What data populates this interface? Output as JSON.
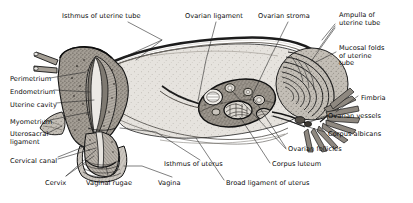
{
  "figure": {
    "type": "anatomical-illustration",
    "style": "grayscale line drawing with stippled shading",
    "background_color": "#ffffff",
    "line_color": "#111111",
    "palette": {
      "broad_ligament_fill": "#e0ddd8",
      "uterine_wall_fill": "#b8b3ac",
      "endometrium_fill": "#9b958d",
      "myometrium_fill": "#a8a29a",
      "ovary_fill": "#8f8981",
      "tube_fill": "#c9c4bd",
      "follicle_fill": "#f2f0ec",
      "corpus_luteum_fill": "#d8d4cd",
      "dark_outline": "#1a1a1a"
    }
  },
  "labels": [
    {
      "id": "isthmus-of-uterine-tube",
      "text": "Isthmus of uterine tube",
      "lines": [
        "Isthmus of uterine tube"
      ],
      "x": 62,
      "y": 13,
      "align": "left"
    },
    {
      "id": "ovarian-ligament",
      "text": "Ovarian ligament",
      "lines": [
        "Ovarian ligament"
      ],
      "x": 185,
      "y": 13,
      "align": "left"
    },
    {
      "id": "ovarian-stroma",
      "text": "Ovarian stroma",
      "lines": [
        "Ovarian stroma"
      ],
      "x": 258,
      "y": 13,
      "align": "left"
    },
    {
      "id": "ampulla-of-uterine-tube",
      "text": "Ampulla of uterine tube",
      "lines": [
        "Ampulla of",
        "uterine tube"
      ],
      "x": 339,
      "y": 12,
      "align": "left"
    },
    {
      "id": "mucosal-folds-of-uterine-tube",
      "text": "Mucosal folds of uterine tube",
      "lines": [
        "Mucosal folds",
        "of uterine",
        "tube"
      ],
      "x": 339,
      "y": 45,
      "align": "left"
    },
    {
      "id": "fimbria",
      "text": "Fimbria",
      "lines": [
        "Fimbria"
      ],
      "x": 361,
      "y": 95,
      "align": "left"
    },
    {
      "id": "ovarian-vessels",
      "text": "Ovarian vessels",
      "lines": [
        "Ovarian vessels"
      ],
      "x": 328,
      "y": 113,
      "align": "left"
    },
    {
      "id": "corpus-albicans",
      "text": "Corpus albicans",
      "lines": [
        "Corpus albicans"
      ],
      "x": 328,
      "y": 131,
      "align": "left"
    },
    {
      "id": "ovarian-follicles",
      "text": "Ovarian follicles",
      "lines": [
        "Ovarian follicles"
      ],
      "x": 288,
      "y": 146,
      "align": "left"
    },
    {
      "id": "corpus-luteum",
      "text": "Corpus luteum",
      "lines": [
        "Corpus luteum"
      ],
      "x": 272,
      "y": 161,
      "align": "left"
    },
    {
      "id": "broad-ligament-of-uterus",
      "text": "Broad ligament of uterus",
      "lines": [
        "Broad ligament of uterus"
      ],
      "x": 226,
      "y": 180,
      "align": "left"
    },
    {
      "id": "isthmus-of-uterus",
      "text": "Isthmus of uterus",
      "lines": [
        "Isthmus of uterus"
      ],
      "x": 164,
      "y": 161,
      "align": "left"
    },
    {
      "id": "vagina",
      "text": "Vagina",
      "lines": [
        "Vagina"
      ],
      "x": 158,
      "y": 180,
      "align": "left"
    },
    {
      "id": "vaginal-rugae",
      "text": "Vaginal rugae",
      "lines": [
        "Vaginal rugae"
      ],
      "x": 86,
      "y": 180,
      "align": "left"
    },
    {
      "id": "cervix",
      "text": "Cervix",
      "lines": [
        "Cervix"
      ],
      "x": 45,
      "y": 180,
      "align": "left"
    },
    {
      "id": "cervical-canal",
      "text": "Cervical canal",
      "lines": [
        "Cervical canal"
      ],
      "x": 10,
      "y": 158,
      "align": "left"
    },
    {
      "id": "uterosacral-ligament",
      "text": "Uterosacral ligament",
      "lines": [
        "Uterosacral",
        "ligament"
      ],
      "x": 10,
      "y": 131,
      "align": "left"
    },
    {
      "id": "myometrium",
      "text": "Myometrium",
      "lines": [
        "Myometrium"
      ],
      "x": 10,
      "y": 119,
      "align": "left"
    },
    {
      "id": "uterine-cavity",
      "text": "Uterine cavity",
      "lines": [
        "Uterine cavity"
      ],
      "x": 10,
      "y": 102,
      "align": "left"
    },
    {
      "id": "endometrium",
      "text": "Endometrium",
      "lines": [
        "Endometrium"
      ],
      "x": 10,
      "y": 89,
      "align": "left"
    },
    {
      "id": "perimetrium",
      "text": "Perimetrium",
      "lines": [
        "Perimetrium"
      ],
      "x": 10,
      "y": 76,
      "align": "left"
    }
  ],
  "structures": [
    {
      "id": "uterine-tube",
      "name": "Uterine tube"
    },
    {
      "id": "uterus-body",
      "name": "Body of uterus"
    },
    {
      "id": "cervix-structure",
      "name": "Cervix"
    },
    {
      "id": "vagina-structure",
      "name": "Vagina"
    },
    {
      "id": "ovary",
      "name": "Ovary"
    },
    {
      "id": "broad-ligament",
      "name": "Broad ligament"
    },
    {
      "id": "fimbriae",
      "name": "Fimbriae"
    }
  ]
}
